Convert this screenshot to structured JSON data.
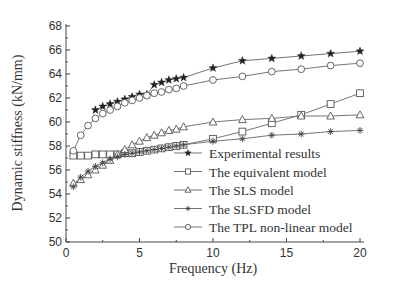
{
  "chart_data": {
    "type": "line",
    "title": "",
    "xlabel": "Frequency (Hz)",
    "ylabel": "Dynamic stiffness (kN/mm)",
    "xlim": [
      0,
      20
    ],
    "ylim": [
      50,
      68
    ],
    "xticks": [
      0,
      5,
      10,
      15,
      20
    ],
    "yticks": [
      50,
      52,
      54,
      56,
      58,
      60,
      62,
      64,
      66,
      68
    ],
    "grid": false,
    "legend_position": "lower right",
    "series": [
      {
        "name": "Experimental results",
        "marker": "star",
        "x": [
          2,
          2.5,
          3,
          3.5,
          4,
          4.5,
          5,
          5.5,
          6,
          6.5,
          7,
          7.5,
          8,
          10,
          12,
          14,
          16,
          18,
          20
        ],
        "values": [
          61.0,
          61.3,
          61.5,
          61.7,
          61.9,
          62.1,
          62.3,
          62.3,
          63.1,
          63.3,
          63.5,
          63.6,
          63.7,
          64.5,
          65.1,
          65.3,
          65.5,
          65.7,
          65.9
        ]
      },
      {
        "name": "The equivalent model",
        "marker": "square",
        "x": [
          0.5,
          1,
          1.5,
          2,
          2.5,
          3,
          3.5,
          4,
          4.5,
          5,
          5.5,
          6,
          6.5,
          7,
          7.5,
          8,
          10,
          12,
          14,
          16,
          18,
          20
        ],
        "values": [
          57.2,
          57.2,
          57.2,
          57.3,
          57.3,
          57.3,
          57.3,
          57.4,
          57.4,
          57.5,
          57.6,
          57.7,
          57.8,
          57.9,
          58.0,
          58.1,
          58.6,
          59.2,
          59.9,
          60.6,
          61.5,
          62.4
        ]
      },
      {
        "name": "The SLS model",
        "marker": "triangle",
        "x": [
          0.5,
          1,
          1.5,
          2,
          2.5,
          3,
          3.5,
          4,
          4.5,
          5,
          5.5,
          6,
          6.5,
          7,
          7.5,
          8,
          10,
          12,
          14,
          16,
          18,
          20
        ],
        "values": [
          54.9,
          55.2,
          55.6,
          56.0,
          56.4,
          56.8,
          57.3,
          57.7,
          58.1,
          58.4,
          58.7,
          58.9,
          59.1,
          59.3,
          59.4,
          59.6,
          60.0,
          60.2,
          60.3,
          60.5,
          60.5,
          60.6
        ]
      },
      {
        "name": "The SLSFD model",
        "marker": "asterisk",
        "x": [
          0.5,
          1,
          1.5,
          2,
          2.5,
          3,
          3.5,
          4,
          4.5,
          5,
          5.5,
          6,
          6.5,
          7,
          7.5,
          8,
          10,
          12,
          14,
          16,
          18,
          20
        ],
        "values": [
          54.6,
          55.4,
          55.9,
          56.3,
          56.6,
          56.9,
          57.1,
          57.3,
          57.4,
          57.5,
          57.6,
          57.7,
          57.8,
          57.9,
          58.0,
          58.1,
          58.4,
          58.6,
          58.9,
          59.0,
          59.2,
          59.3
        ]
      },
      {
        "name": "The TPL non-linear model",
        "marker": "circle",
        "x": [
          0.5,
          1,
          1.5,
          2,
          2.5,
          3,
          3.5,
          4,
          4.5,
          5,
          5.5,
          6,
          6.5,
          7,
          7.5,
          8,
          10,
          12,
          14,
          16,
          18,
          20
        ],
        "values": [
          57.6,
          58.9,
          59.7,
          60.3,
          60.7,
          61.0,
          61.3,
          61.6,
          61.8,
          62.0,
          62.2,
          62.4,
          62.5,
          62.7,
          62.8,
          63.0,
          63.5,
          63.8,
          64.2,
          64.4,
          64.7,
          64.9
        ]
      }
    ]
  },
  "labels": {
    "xlabel": "Frequency (Hz)",
    "ylabel": "Dynamic stiffness (kN/mm)",
    "xtick_labels": [
      "0",
      "5",
      "10",
      "15",
      "20"
    ],
    "ytick_labels": [
      "50",
      "52",
      "54",
      "56",
      "58",
      "60",
      "62",
      "64",
      "66",
      "68"
    ],
    "legend": [
      "Experimental results",
      "The equivalent model",
      "The SLS model",
      "The SLSFD model",
      "The TPL non-linear model"
    ]
  },
  "colors": {
    "marker_fill_star": "#222222",
    "line": "#666666",
    "axis": "#444444",
    "text": "#333333",
    "background": "#ffffff"
  }
}
